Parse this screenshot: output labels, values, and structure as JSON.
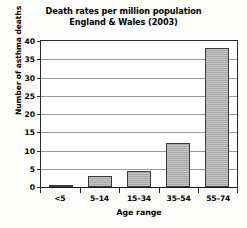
{
  "chart_data": {
    "type": "bar",
    "title": "Death rates per million population England & Wales (2003)",
    "title_lines": [
      "Death rates per million population",
      "England & Wales (2003)"
    ],
    "xlabel": "Age range",
    "ylabel": "Number of asthma deaths",
    "categories": [
      "<5",
      "5–14",
      "15–34",
      "35–54",
      "55–74"
    ],
    "values": [
      0.5,
      3,
      4.5,
      12,
      38
    ],
    "ylim": [
      0,
      40
    ],
    "yticks": [
      0,
      5,
      10,
      15,
      20,
      25,
      30,
      35,
      40
    ],
    "ytick_labels": [
      "0",
      "5",
      "10",
      "15",
      "20",
      "25",
      "30",
      "35",
      "40"
    ],
    "grid": true,
    "legend": null,
    "bar_color": "#a9a9a9",
    "bar_edge_color": "#3a3a3a",
    "axis_color": "#2a2a2a",
    "gridline_color": "#9a9a9a",
    "background_color": "#ffffff"
  }
}
